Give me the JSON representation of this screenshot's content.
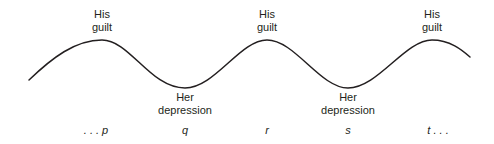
{
  "diagram": {
    "peaks": [
      {
        "line1": "His",
        "line2": "guilt"
      },
      {
        "line1": "His",
        "line2": "guilt"
      },
      {
        "line1": "His",
        "line2": "guilt"
      }
    ],
    "troughs": [
      {
        "line1": "Her",
        "line2": "depression"
      },
      {
        "line1": "Her",
        "line2": "depression"
      }
    ],
    "axis_labels": [
      ". . . p",
      "q",
      "r",
      "s",
      "t . . ."
    ],
    "curve_color": "#231f20"
  }
}
